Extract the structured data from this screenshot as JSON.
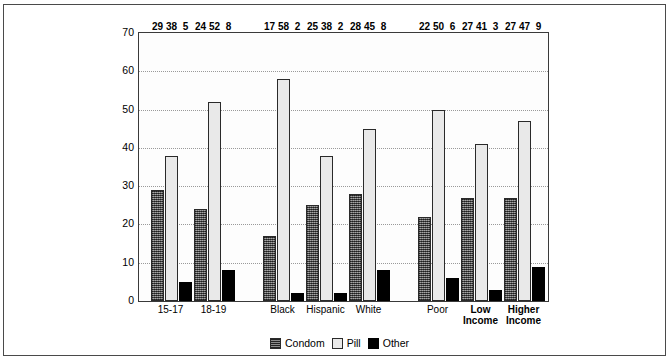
{
  "chart_data": {
    "type": "bar",
    "title": "",
    "xlabel": "",
    "ylabel": "",
    "ylim": [
      0,
      70
    ],
    "ytick_values": [
      0,
      10,
      20,
      30,
      40,
      50,
      60,
      70
    ],
    "grid": true,
    "legend_position": "bottom-center",
    "categories": [
      "15-17",
      "18-19",
      "Black",
      "Hispanic",
      "White",
      "Poor",
      "Low Income",
      "Higher Income"
    ],
    "series": [
      {
        "name": "Condom",
        "values": [
          29,
          24,
          17,
          25,
          28,
          22,
          27,
          27
        ]
      },
      {
        "name": "Pill",
        "values": [
          38,
          52,
          58,
          38,
          45,
          50,
          41,
          47
        ]
      },
      {
        "name": "Other",
        "values": [
          5,
          8,
          2,
          2,
          8,
          6,
          3,
          9
        ]
      }
    ]
  },
  "axis": {
    "yticks": [
      {
        "label": "70",
        "value": 70
      },
      {
        "label": "60",
        "value": 60
      },
      {
        "label": "50",
        "value": 50
      },
      {
        "label": "40",
        "value": 40
      },
      {
        "label": "30",
        "value": 30
      },
      {
        "label": "20",
        "value": 20
      },
      {
        "label": "10",
        "value": 10
      },
      {
        "label": "0",
        "value": 0
      }
    ]
  },
  "clusters": [
    {
      "name": "age",
      "groups": [
        {
          "label": "15-17",
          "bold": false,
          "values": {
            "Condom": 29,
            "Pill": 38,
            "Other": 5
          }
        },
        {
          "label": "18-19",
          "bold": false,
          "values": {
            "Condom": 24,
            "Pill": 52,
            "Other": 8
          }
        }
      ]
    },
    {
      "name": "race",
      "groups": [
        {
          "label": "Black",
          "bold": false,
          "values": {
            "Condom": 17,
            "Pill": 58,
            "Other": 2
          }
        },
        {
          "label": "Hispanic",
          "bold": false,
          "values": {
            "Condom": 25,
            "Pill": 38,
            "Other": 2
          }
        },
        {
          "label": "White",
          "bold": false,
          "values": {
            "Condom": 28,
            "Pill": 45,
            "Other": 8
          }
        }
      ]
    },
    {
      "name": "income",
      "groups": [
        {
          "label": "Poor",
          "bold": false,
          "values": {
            "Condom": 22,
            "Pill": 50,
            "Other": 6
          }
        },
        {
          "label": "Low\nIncome",
          "bold": true,
          "values": {
            "Condom": 27,
            "Pill": 41,
            "Other": 3
          }
        },
        {
          "label": "Higher\nIncome",
          "bold": true,
          "values": {
            "Condom": 27,
            "Pill": 47,
            "Other": 9
          }
        }
      ]
    }
  ],
  "legend": {
    "items": [
      {
        "label": "Condom",
        "swatch": "condom",
        "color": "#5a5a5a"
      },
      {
        "label": "Pill",
        "swatch": "pill",
        "color": "#e9e9e9"
      },
      {
        "label": "Other",
        "swatch": "other",
        "color": "#000000"
      }
    ]
  }
}
